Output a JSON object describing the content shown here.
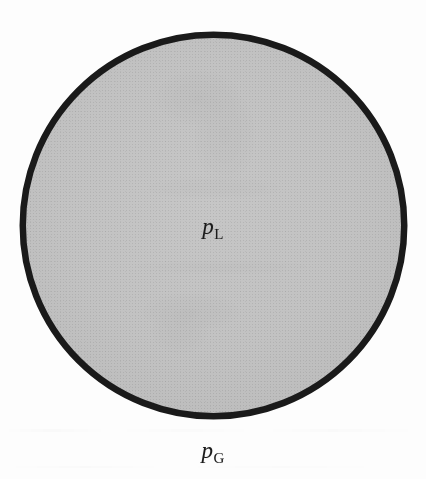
{
  "figure": {
    "kind": "scientific-diagram",
    "background_color": "#fdfdfd"
  },
  "droplet": {
    "shape": "circle",
    "center_x": 213.5,
    "center_y": 225.5,
    "outer_radius": 194,
    "stroke_width": 6.5,
    "stroke_color": "#1a1a1a",
    "fill_color": "#c2c2c2"
  },
  "labels": {
    "liquid": {
      "symbol": "p",
      "subscript": "L",
      "full": "pL",
      "meaning": "liquid pressure",
      "x": 213,
      "y": 228,
      "color": "#1b1b1b"
    },
    "gas": {
      "symbol": "p",
      "subscript": "G",
      "full": "pG",
      "meaning": "gas pressure",
      "x": 213,
      "y": 452,
      "color": "#1b1b1b"
    }
  }
}
